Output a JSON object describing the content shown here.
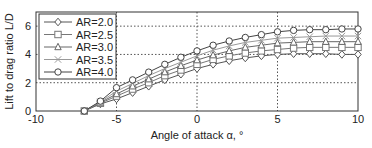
{
  "chart_data": {
    "type": "line",
    "title": "",
    "xlabel": "Angle of attack α, °",
    "ylabel": "Lift to drag ratio L/D",
    "xlim": [
      -10,
      10
    ],
    "ylim": [
      0,
      7
    ],
    "xticks": [
      -10,
      -5,
      0,
      5,
      10
    ],
    "yticks": [
      0,
      2,
      4,
      6
    ],
    "grid": "dotted at ticks",
    "legend_position": "upper-left",
    "x": [
      -7,
      -6,
      -5,
      -4,
      -3,
      -2,
      -1,
      0,
      1,
      2,
      3,
      4,
      5,
      6,
      7,
      8,
      9,
      10
    ],
    "series": [
      {
        "name": "AR=2.0",
        "marker": "diamond",
        "color": "#555555",
        "values": [
          0,
          0.5,
          0.85,
          1.3,
          1.75,
          2.2,
          2.6,
          3.0,
          3.3,
          3.55,
          3.75,
          3.9,
          4.0,
          4.05,
          4.05,
          4.05,
          4.0,
          4.0
        ]
      },
      {
        "name": "AR=2.5",
        "marker": "square",
        "color": "#777777",
        "values": [
          0,
          0.55,
          1.05,
          1.55,
          2.0,
          2.5,
          2.9,
          3.3,
          3.65,
          3.9,
          4.1,
          4.25,
          4.35,
          4.45,
          4.5,
          4.5,
          4.5,
          4.5
        ]
      },
      {
        "name": "AR=3.0",
        "marker": "triangle",
        "color": "#666666",
        "values": [
          0,
          0.6,
          1.2,
          1.75,
          2.25,
          2.75,
          3.2,
          3.6,
          3.95,
          4.25,
          4.5,
          4.65,
          4.8,
          4.85,
          4.9,
          4.9,
          4.9,
          4.9
        ]
      },
      {
        "name": "AR=3.5",
        "marker": "x",
        "color": "#999999",
        "values": [
          0,
          0.65,
          1.4,
          1.95,
          2.5,
          3.0,
          3.45,
          3.9,
          4.3,
          4.6,
          4.85,
          5.0,
          5.15,
          5.2,
          5.25,
          5.3,
          5.3,
          5.3
        ]
      },
      {
        "name": "AR=4.0",
        "marker": "circle",
        "color": "#444444",
        "values": [
          0,
          0.7,
          1.65,
          2.2,
          2.75,
          3.3,
          3.8,
          4.25,
          4.65,
          4.95,
          5.2,
          5.4,
          5.6,
          5.7,
          5.75,
          5.75,
          5.8,
          5.8
        ]
      }
    ]
  }
}
